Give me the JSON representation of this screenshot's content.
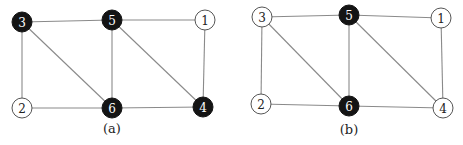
{
  "figures": [
    {
      "caption": "(a)",
      "caption_pos": [
        112,
        133
      ],
      "nodes": [
        {
          "id": "3",
          "x": 22,
          "y": 22,
          "filled": true
        },
        {
          "id": "5",
          "x": 112,
          "y": 20,
          "filled": true
        },
        {
          "id": "1",
          "x": 205,
          "y": 20,
          "filled": false
        },
        {
          "id": "2",
          "x": 22,
          "y": 108,
          "filled": false
        },
        {
          "id": "6",
          "x": 112,
          "y": 108,
          "filled": true
        },
        {
          "id": "4",
          "x": 203,
          "y": 107,
          "filled": true
        }
      ],
      "edges": [
        [
          "3",
          "5"
        ],
        [
          "5",
          "1"
        ],
        [
          "3",
          "2"
        ],
        [
          "3",
          "6"
        ],
        [
          "5",
          "6"
        ],
        [
          "5",
          "4"
        ],
        [
          "1",
          "4"
        ],
        [
          "2",
          "6"
        ],
        [
          "6",
          "4"
        ]
      ]
    },
    {
      "caption": "(b)",
      "caption_pos": [
        349,
        134
      ],
      "nodes": [
        {
          "id": "3",
          "x": 262,
          "y": 17,
          "filled": false
        },
        {
          "id": "5",
          "x": 349,
          "y": 15,
          "filled": true
        },
        {
          "id": "1",
          "x": 441,
          "y": 18,
          "filled": false
        },
        {
          "id": "2",
          "x": 261,
          "y": 104,
          "filled": false
        },
        {
          "id": "6",
          "x": 349,
          "y": 106,
          "filled": true
        },
        {
          "id": "4",
          "x": 443,
          "y": 108,
          "filled": false
        }
      ],
      "edges": [
        [
          "3",
          "5"
        ],
        [
          "5",
          "1"
        ],
        [
          "3",
          "2"
        ],
        [
          "3",
          "6"
        ],
        [
          "5",
          "6"
        ],
        [
          "5",
          "4"
        ],
        [
          "1",
          "4"
        ],
        [
          "2",
          "6"
        ],
        [
          "6",
          "4"
        ]
      ]
    }
  ],
  "style": {
    "node_radius": 10,
    "filled_color": "#141414",
    "empty_color": "#ffffff",
    "edge_color": "#8a8a8a"
  }
}
